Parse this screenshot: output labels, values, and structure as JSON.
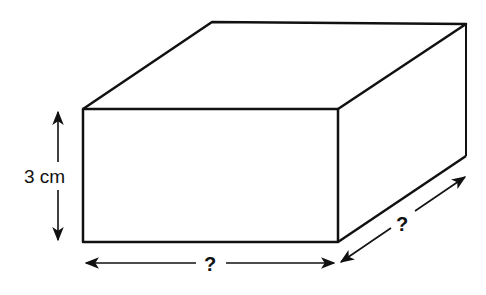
{
  "diagram": {
    "type": "cuboid",
    "labels": {
      "height": "3 cm",
      "length": "?",
      "depth": "?"
    },
    "colors": {
      "stroke": "#111111",
      "background": "#ffffff"
    }
  }
}
